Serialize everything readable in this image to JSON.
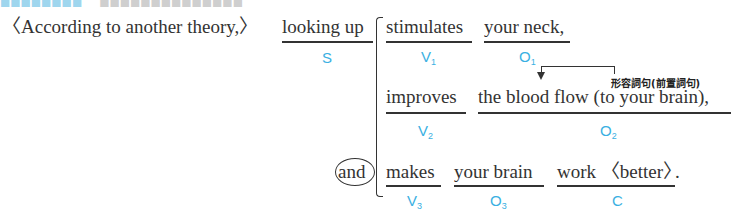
{
  "header_fragment": {
    "visible": "partially cut off at top"
  },
  "sentence": {
    "adverbial": "〈According to another theory,〉",
    "subject": {
      "text": "looking up",
      "label": "S"
    },
    "clauses": [
      {
        "verb": {
          "text": "stimulates",
          "label": "V",
          "sub": "1"
        },
        "object": {
          "text": "your neck,",
          "label": "O",
          "sub": "1"
        }
      },
      {
        "verb": {
          "text": "improves",
          "label": "V",
          "sub": "2"
        },
        "object": {
          "text": "the blood flow (to your brain),",
          "label": "O",
          "sub": "2"
        },
        "annotation": "形容詞句(前置詞句)"
      },
      {
        "conjunction": "and",
        "verb": {
          "text": "makes",
          "label": "V",
          "sub": "3"
        },
        "object": {
          "text": "your brain",
          "label": "O",
          "sub": "3"
        },
        "complement": {
          "text": "work 〈better〉",
          "label": "C"
        },
        "end": "."
      }
    ]
  },
  "colors": {
    "text": "#333333",
    "label": "#3ab0e2"
  }
}
